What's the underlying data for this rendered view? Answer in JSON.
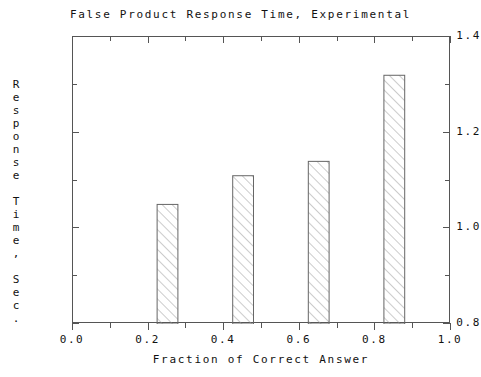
{
  "chart_data": {
    "type": "bar",
    "title": "False Product Response Time, Experimental",
    "xlabel": "Fraction of Correct Answer",
    "ylabel": "Response Time, Sec.",
    "xlim": [
      0.0,
      1.0
    ],
    "ylim": [
      0.8,
      1.4
    ],
    "grid": false,
    "legend": null,
    "x": [
      0.25,
      0.45,
      0.65,
      0.85
    ],
    "values": [
      1.05,
      1.11,
      1.14,
      1.32
    ],
    "bar_width": 0.055,
    "bar_fill": "hatch-diagonal",
    "categories": [
      "0.25",
      "0.45",
      "0.65",
      "0.85"
    ],
    "xticks_major": [
      "0.0",
      "0.2",
      "0.4",
      "0.6",
      "0.8",
      "1.0"
    ],
    "xticks_major_values": [
      0.0,
      0.2,
      0.4,
      0.6,
      0.8,
      1.0
    ],
    "xticks_minor_values": [
      0.1,
      0.3,
      0.5,
      0.7,
      0.9
    ],
    "yticks_major": [
      "0.8",
      "1.0",
      "1.2",
      "1.4"
    ],
    "yticks_major_values": [
      0.8,
      1.0,
      1.2,
      1.4
    ],
    "yticks_minor_values": [
      0.9,
      1.1,
      1.3
    ],
    "series": [
      {
        "name": "Experimental",
        "points": [
          {
            "x": 0.25,
            "y": 1.05
          },
          {
            "x": 0.45,
            "y": 1.11
          },
          {
            "x": 0.65,
            "y": 1.14
          },
          {
            "x": 0.85,
            "y": 1.32
          }
        ]
      }
    ]
  },
  "colors": {
    "background": "#ffffff",
    "axis": "#555555",
    "text": "#111111",
    "bar_outline": "#666666",
    "bar_hatch": "#999999"
  },
  "yaxis_title_chars": [
    "R",
    "e",
    "s",
    "p",
    "o",
    "n",
    "s",
    "e",
    "",
    "T",
    "i",
    "m",
    "e",
    ",",
    "",
    "S",
    "e",
    "c",
    "."
  ]
}
